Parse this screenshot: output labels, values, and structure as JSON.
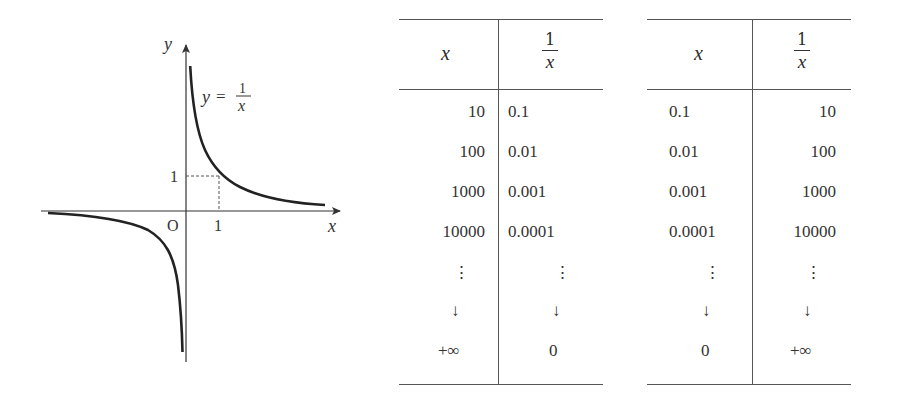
{
  "graph": {
    "function_label": "y = 1/x",
    "function_lhs": "y",
    "function_eq": "=",
    "function_num": "1",
    "function_den": "x",
    "x_axis_label": "x",
    "y_axis_label": "y",
    "origin_label": "O",
    "x_tick_label": "1",
    "y_tick_label": "1"
  },
  "table_left": {
    "headers": {
      "x": "x",
      "recip_num": "1",
      "recip_den": "x"
    },
    "rows": [
      {
        "x": "10",
        "recip": "0.1"
      },
      {
        "x": "100",
        "recip": "0.01"
      },
      {
        "x": "1000",
        "recip": "0.001"
      },
      {
        "x": "10000",
        "recip": "0.0001"
      },
      {
        "x": "⋮",
        "recip": "⋮"
      },
      {
        "x": "↓",
        "recip": "↓"
      },
      {
        "x": "+∞",
        "recip": "0"
      }
    ]
  },
  "table_right": {
    "headers": {
      "x": "x",
      "recip_num": "1",
      "recip_den": "x"
    },
    "rows": [
      {
        "x": "0.1",
        "recip": "10"
      },
      {
        "x": "0.01",
        "recip": "100"
      },
      {
        "x": "0.001",
        "recip": "1000"
      },
      {
        "x": "0.0001",
        "recip": "10000"
      },
      {
        "x": "⋮",
        "recip": "⋮"
      },
      {
        "x": "↓",
        "recip": "↓"
      },
      {
        "x": "0",
        "recip": "+∞"
      }
    ]
  }
}
